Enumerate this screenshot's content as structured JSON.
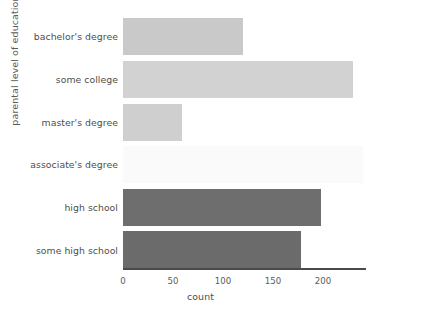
{
  "chart_data": {
    "type": "bar",
    "orientation": "horizontal",
    "title": "",
    "xlabel": "count",
    "ylabel": "parental level of education",
    "categories": [
      "bachelor's degree",
      "some college",
      "master's degree",
      "associate's degree",
      "high school",
      "some high school"
    ],
    "values": [
      120,
      230,
      59,
      240,
      198,
      178
    ],
    "bar_colors": [
      "#c9c9c9",
      "#d2d2d2",
      "#cfcfcf",
      "#fafafa",
      "#6e6e6e",
      "#6b6b6b"
    ],
    "xlim": [
      0,
      243
    ],
    "xticks": [
      0,
      50,
      100,
      150,
      200
    ],
    "xtick_labels": [
      "0",
      "50",
      "100",
      "150",
      "200"
    ],
    "grid": false,
    "legend": null
  },
  "axes": {
    "x_axis_name": "count-axis",
    "y_axis_name": "education-axis"
  }
}
